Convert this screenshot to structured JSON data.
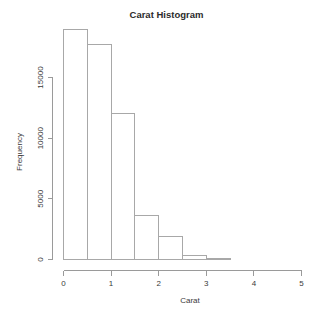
{
  "chart_data": {
    "type": "bar",
    "title": "Carat Histogram",
    "xlabel": "Carat",
    "ylabel": "Frequency",
    "grid": false,
    "legend": false,
    "bin_width": 0.5,
    "xlim": [
      0,
      5
    ],
    "ylim": [
      0,
      19000
    ],
    "x_ticks": [
      0,
      1,
      2,
      3,
      4,
      5
    ],
    "x_tick_labels": [
      "0",
      "1",
      "2",
      "3",
      "4",
      "5"
    ],
    "y_ticks": [
      0,
      5000,
      10000,
      15000
    ],
    "y_tick_labels": [
      "0",
      "5000",
      "10000",
      "15000"
    ],
    "categories": [
      "0-0.5",
      "0.5-1",
      "1-1.5",
      "1.5-2",
      "2-2.5",
      "2.5-3",
      "3-3.5"
    ],
    "bin_edges": [
      0,
      0.5,
      1.0,
      1.5,
      2.0,
      2.5,
      3.0,
      3.5
    ],
    "values": [
      18950,
      17700,
      12030,
      3625,
      1895,
      300,
      50
    ],
    "bar_fill": "#ffffff",
    "bar_stroke": "#a8a8a8",
    "axis_color": "#9a9a9a",
    "text_color": "#3a3a3a",
    "title_color": "#2b2b2b",
    "background": "#ffffff"
  },
  "labels": {
    "title": "Carat Histogram",
    "x_axis_title": "Carat",
    "y_axis_title": "Frequency"
  }
}
